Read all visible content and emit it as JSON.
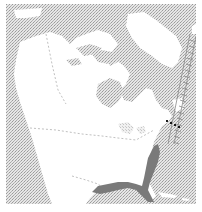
{
  "map": {
    "title": "",
    "region": "North America",
    "projection": "polar-oblique",
    "colors": {
      "ocean_pattern_dark": "#9a9a9a",
      "ocean_pattern_light": "#d8d8d8",
      "land": "#ffffff",
      "range_fill": "#7a7a7a",
      "border_dashes": "#b0b0b0",
      "points": "#1a1a1a",
      "hatch_line": "#8a8a8a"
    },
    "layers": [
      {
        "name": "ocean",
        "style": "stippled-gray"
      },
      {
        "name": "land",
        "style": "white"
      },
      {
        "name": "political-borders",
        "style": "dashed-gray"
      },
      {
        "name": "species-range",
        "style": "solid-dark-gray",
        "extent": "US Atlantic coast (New Jersey to Florida) and Gulf coast to Texas"
      },
      {
        "name": "occurrence-points",
        "style": "black-dots",
        "count": 4,
        "extent": "Northeast US coast / Nova Scotia"
      },
      {
        "name": "migration-route",
        "style": "ladder-hatch",
        "extent": "Western Atlantic offshore, Greenland to mid-Atlantic"
      }
    ]
  }
}
